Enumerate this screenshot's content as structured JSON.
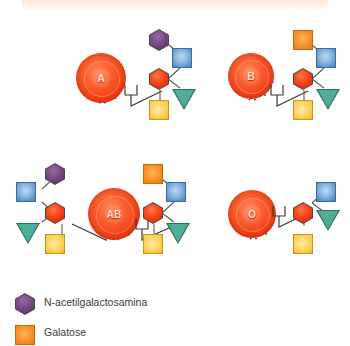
{
  "figure": {
    "title_band": "",
    "background": "#ffffff",
    "top_band_color": "#fbe6d6"
  },
  "palette": {
    "n_acetylgalactosamine": "#7a4b87",
    "galactose": "#f89730",
    "blue_sugar": "#6ea3d4",
    "red_sugar": "#f4461c",
    "yellow_sugar": "#ffd86b",
    "teal_sugar": "#4fae98",
    "rbc": "#f4461c",
    "line": "#5b5b5b",
    "text": "#3a3a3a"
  },
  "groups": [
    {
      "id": "group-a",
      "cell_label": "A",
      "terminal_sugar": "n-acetylgalactosamine-hexagon",
      "mirrored": false,
      "sugars": [
        "n-acetylgalactosamine-hexagon",
        "blue-square",
        "red-hexagon",
        "yellow-square",
        "teal-triangle"
      ]
    },
    {
      "id": "group-b",
      "cell_label": "B",
      "terminal_sugar": "galactose-square",
      "mirrored": false,
      "sugars": [
        "galactose-square",
        "blue-square",
        "red-hexagon",
        "yellow-square",
        "teal-triangle"
      ]
    },
    {
      "id": "group-ab",
      "cell_label": "AB",
      "terminal_sugar": "both",
      "mirrored": true,
      "sugars_left": [
        "n-acetylgalactosamine-hexagon",
        "blue-square",
        "red-hexagon",
        "yellow-square",
        "teal-triangle"
      ],
      "sugars_right": [
        "galactose-square",
        "blue-square",
        "red-hexagon",
        "yellow-square",
        "teal-triangle"
      ]
    },
    {
      "id": "group-o",
      "cell_label": "O",
      "terminal_sugar": "none",
      "mirrored": false,
      "sugars": [
        "blue-square",
        "red-hexagon",
        "yellow-square",
        "teal-triangle"
      ]
    }
  ],
  "legend": {
    "items": [
      {
        "icon": "hexagon",
        "color": "#7a4b87",
        "label": "N-acetilgalactosamina"
      },
      {
        "icon": "square",
        "color": "#f89730",
        "label": "Galatose"
      }
    ]
  }
}
